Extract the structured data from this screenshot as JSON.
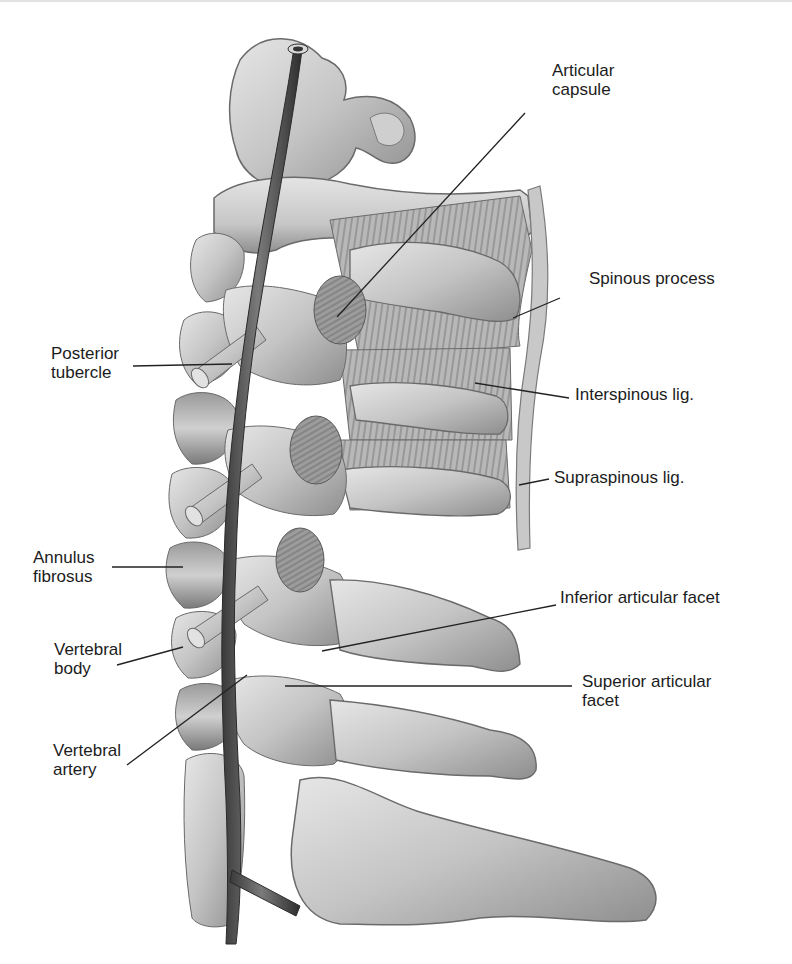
{
  "figure": {
    "type": "anatomical-illustration",
    "palette": {
      "background": "#ffffff",
      "bone_light": "#dcdcdc",
      "bone_mid": "#b4b4b4",
      "bone_dark": "#7a7a7a",
      "artery": "#5a5a5a",
      "ligament_band": "#c8c8c8",
      "leader_line": "#222222",
      "text": "#1c1c1c"
    }
  },
  "labels": {
    "articular_capsule": {
      "line1": "Articular",
      "line2": "capsule"
    },
    "spinous_process": {
      "line1": "Spinous process"
    },
    "posterior_tubercle": {
      "line1": "Posterior",
      "line2": "tubercle"
    },
    "interspinous_lig": {
      "line1": "Interspinous lig."
    },
    "supraspinous_lig": {
      "line1": "Supraspinous lig."
    },
    "annulus_fibrosus": {
      "line1": "Annulus",
      "line2": "fibrosus"
    },
    "inferior_articular_facet": {
      "line1": "Inferior articular facet"
    },
    "vertebral_body": {
      "line1": "Vertebral",
      "line2": "body"
    },
    "superior_articular_facet": {
      "line1": "Superior articular",
      "line2": "facet"
    },
    "vertebral_artery": {
      "line1": "Vertebral",
      "line2": "artery"
    }
  }
}
